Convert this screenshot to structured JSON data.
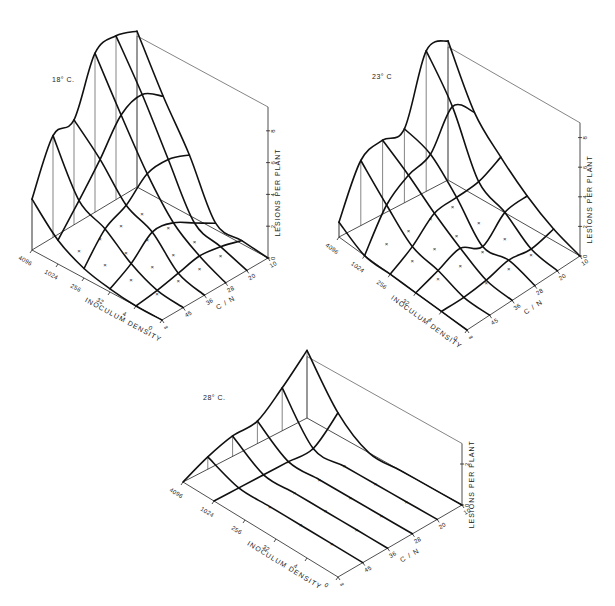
{
  "chart_data": [
    {
      "type": "surface3d",
      "title": "18° C.",
      "xlabel": "INOCULUM DENSITY",
      "ylabel": "C / N",
      "zlabel": "LESIONS PER PLANT",
      "inoculum_ticks": [
        "4096",
        "1024",
        "256",
        "32",
        "4",
        "0"
      ],
      "cn_ticks": [
        "10",
        "20",
        "28",
        "36",
        "45",
        "∞"
      ],
      "z_ticks": [
        "0",
        "2",
        "4",
        "6",
        "8"
      ],
      "zlim": [
        0,
        9.5
      ],
      "geometry": {
        "left": [
          32,
          250
        ],
        "back": [
          137,
          187
        ],
        "right": [
          268,
          258
        ],
        "front": [
          162,
          320
        ],
        "unit_px": 15.9
      },
      "surface_note": "rows = inoculum (4096..0), cols = C/N (∞..10); estimated lesions per plant",
      "values": [
        [
          3.2,
          6.4,
          6.6,
          10.0,
          10.3,
          9.8
        ],
        [
          1.5,
          3.2,
          5.0,
          7.0,
          7.5,
          6.6
        ],
        [
          0.6,
          2.3,
          3.0,
          4.2,
          4.3,
          3.8
        ],
        [
          0.2,
          1.0,
          2.2,
          2.0,
          1.2,
          0.4
        ],
        [
          0.0,
          0.2,
          0.5,
          0.8,
          0.6,
          0.2
        ],
        [
          0.0,
          0.0,
          0.0,
          0.0,
          0.0,
          0.0
        ]
      ]
    },
    {
      "type": "surface3d",
      "title": "23° C",
      "xlabel": "INOCULUM DENSITY",
      "ylabel": "C / N",
      "zlabel": "LESIONS PER PLANT",
      "inoculum_ticks": [
        "4096",
        "1024",
        "256",
        "32",
        "4",
        "0"
      ],
      "cn_ticks": [
        "10",
        "20",
        "28",
        "36",
        "45",
        "∞"
      ],
      "z_ticks": [
        "0",
        "2",
        "4",
        "6",
        "8"
      ],
      "zlim": [
        0,
        9
      ],
      "geometry": {
        "left": [
          339,
          237
        ],
        "back": [
          448,
          180
        ],
        "right": [
          580,
          256
        ],
        "front": [
          467,
          330
        ],
        "unit_px": 14.8
      },
      "surface_note": "rows = inoculum (4096..0), cols = C/N (∞..10); estimated lesions per plant",
      "values": [
        [
          1.0,
          4.4,
          5.0,
          5.0,
          9.5,
          9.4
        ],
        [
          0.0,
          2.6,
          3.8,
          4.4,
          6.8,
          5.6
        ],
        [
          0.0,
          1.0,
          2.4,
          2.6,
          2.8,
          3.6
        ],
        [
          0.0,
          0.6,
          1.2,
          0.4,
          1.8,
          2.0
        ],
        [
          0.0,
          0.0,
          0.2,
          0.6,
          0.4,
          0.8
        ],
        [
          0.0,
          0.0,
          0.0,
          0.0,
          0.0,
          0.0
        ]
      ]
    },
    {
      "type": "surface3d",
      "title": "28° C.",
      "xlabel": "INOCULUM DENSITY",
      "ylabel": "C / N",
      "zlabel": "LESIONS PER PLANT",
      "inoculum_ticks": [
        "4096",
        "1024",
        "256",
        "32",
        "4",
        "0"
      ],
      "cn_ticks": [
        "10",
        "20",
        "28",
        "36",
        "45",
        "∞"
      ],
      "z_ticks": [
        "0",
        "2"
      ],
      "zlim": [
        0,
        3
      ],
      "geometry": {
        "left": [
          183,
          482
        ],
        "back": [
          307,
          418
        ],
        "right": [
          462,
          505
        ],
        "front": [
          338,
          577
        ],
        "unit_px": 20.5
      },
      "surface_note": "rows = inoculum (4096..0), cols = C/N (∞..10); estimated lesions per plant",
      "values": [
        [
          0.0,
          0.6,
          1.0,
          1.1,
          2.1,
          3.3
        ],
        [
          0.0,
          0.0,
          0.0,
          0.0,
          0.0,
          1.1
        ],
        [
          0.0,
          0.0,
          0.0,
          0.0,
          0.0,
          0.0
        ],
        [
          0.0,
          0.0,
          0.0,
          0.0,
          0.0,
          0.0
        ],
        [
          0.0,
          0.0,
          0.0,
          0.0,
          0.0,
          0.0
        ],
        [
          0.0,
          0.0,
          0.0,
          0.0,
          0.0,
          0.0
        ]
      ]
    }
  ],
  "panels": {
    "p18": {
      "title": "18° C."
    },
    "p23": {
      "title": "23° C"
    },
    "p28": {
      "title": "28° C."
    }
  },
  "colors": {
    "ink": "#111111",
    "paper": "#ffffff"
  }
}
